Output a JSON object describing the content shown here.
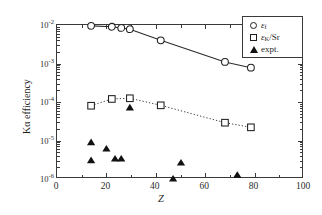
{
  "chart_data": {
    "type": "scatter",
    "title": "",
    "xlabel": "Z",
    "ylabel": "Kα efficiency",
    "xlim": [
      0,
      100
    ],
    "ylim": [
      1e-06,
      0.01
    ],
    "yscale": "log",
    "grid": false,
    "legend_position": "top-right",
    "xticks": [
      0,
      20,
      40,
      60,
      80,
      100
    ],
    "xtick_labels": [
      "0",
      "20",
      "40",
      "60",
      "80",
      "100"
    ],
    "yticks": [
      0.01,
      0.001,
      0.0001,
      1e-05,
      1e-06
    ],
    "ytick_labels": [
      "10⁻²",
      "10⁻³",
      "10⁻⁴",
      "10⁻⁵",
      "10⁻⁶"
    ],
    "series": [
      {
        "name": "εf",
        "label_base": "ε",
        "label_sub": "f",
        "marker": "circle-open",
        "line": "solid",
        "x": [
          13.8,
          22.2,
          26.0,
          29.5,
          42.0,
          68.0,
          78.5
        ],
        "y": [
          0.0095,
          0.009,
          0.0084,
          0.0078,
          0.004,
          0.0011,
          0.00078
        ]
      },
      {
        "name": "εK/Sr",
        "label_base": "ε",
        "label_sub": "K",
        "label_tail": "/Sr",
        "marker": "square-open",
        "line": "dotted",
        "x": [
          13.8,
          22.2,
          29.5,
          42.0,
          68.0,
          78.5
        ],
        "y": [
          8e-05,
          0.00012,
          0.000125,
          8.2e-05,
          2.9e-05,
          2.2e-05
        ]
      },
      {
        "name": "expt.",
        "marker": "triangle-filled",
        "line": "none",
        "x": [
          13.8,
          13.8,
          20.0,
          23.5,
          26.0,
          29.5,
          47.0,
          50.2,
          73.0
        ],
        "y": [
          8.8e-06,
          3e-06,
          6e-06,
          3.3e-06,
          3.3e-06,
          7e-05,
          1e-06,
          2.6e-06,
          1.25e-06
        ]
      }
    ]
  },
  "axes": {
    "x_title": "Z",
    "y_title": "Kα efficiency",
    "x_tick_labels": [
      "0",
      "20",
      "40",
      "60",
      "80",
      "100"
    ],
    "y_tick_mantissa": "10",
    "y_tick_exponents": [
      "-2",
      "-3",
      "-4",
      "-5",
      "-6"
    ]
  },
  "legend": {
    "items": [
      {
        "symbol": "circle-open",
        "base": "ε",
        "sub": "f",
        "tail": ""
      },
      {
        "symbol": "square-open",
        "base": "ε",
        "sub": "K",
        "tail": "/Sr"
      },
      {
        "symbol": "triangle-filled",
        "base": "expt.",
        "sub": "",
        "tail": ""
      }
    ],
    "item_0_text": "εf",
    "item_1_text": "εK/Sr",
    "item_2_text": "expt."
  },
  "colors": {
    "axis": "#3a3a3a",
    "marker_stroke": "#1f1f1f",
    "marker_fill": "#111111",
    "line": "#2b2b2b",
    "background": "#ffffff"
  }
}
